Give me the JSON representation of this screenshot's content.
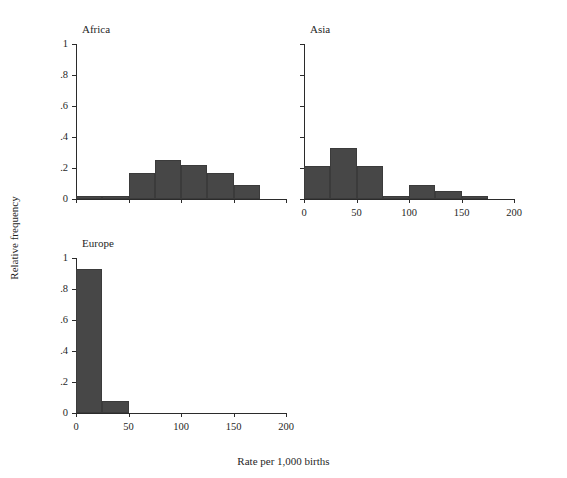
{
  "chart_data": {
    "type": "bar",
    "title": "",
    "subtitle": "",
    "xlabel": "Rate per 1,000 births",
    "ylabel": "Relative frequency",
    "xlim": [
      0,
      200
    ],
    "ylim": [
      0,
      1
    ],
    "grid": false,
    "legend": null,
    "bin_width": 25,
    "bar_color": "#474747",
    "axis_color": "#2b2b2b",
    "background": "#ffffff",
    "xticks": [
      0,
      50,
      100,
      150,
      200
    ],
    "xticklabels": [
      "0",
      "50",
      "100",
      "150",
      "200"
    ],
    "yticks": [
      0,
      0.2,
      0.4,
      0.6,
      0.8,
      1
    ],
    "yticklabels": [
      "0",
      ".2",
      ".4",
      ".6",
      ".8",
      "1"
    ],
    "panels": [
      {
        "name": "Africa",
        "row": 0,
        "col": 0,
        "show_ytick_labels": true,
        "show_xtick_labels": false,
        "bins": [
          {
            "x0": 0,
            "x1": 25,
            "value": 0.02
          },
          {
            "x0": 25,
            "x1": 50,
            "value": 0.02
          },
          {
            "x0": 50,
            "x1": 75,
            "value": 0.17
          },
          {
            "x0": 75,
            "x1": 100,
            "value": 0.25
          },
          {
            "x0": 100,
            "x1": 125,
            "value": 0.22
          },
          {
            "x0": 125,
            "x1": 150,
            "value": 0.17
          },
          {
            "x0": 150,
            "x1": 175,
            "value": 0.09
          }
        ]
      },
      {
        "name": "Asia",
        "row": 0,
        "col": 1,
        "show_ytick_labels": false,
        "show_xtick_labels": true,
        "bins": [
          {
            "x0": 0,
            "x1": 25,
            "value": 0.21
          },
          {
            "x0": 25,
            "x1": 50,
            "value": 0.33
          },
          {
            "x0": 50,
            "x1": 75,
            "value": 0.21
          },
          {
            "x0": 75,
            "x1": 100,
            "value": 0.02
          },
          {
            "x0": 100,
            "x1": 125,
            "value": 0.09
          },
          {
            "x0": 125,
            "x1": 150,
            "value": 0.05
          },
          {
            "x0": 150,
            "x1": 175,
            "value": 0.02
          }
        ]
      },
      {
        "name": "Europe",
        "row": 1,
        "col": 0,
        "show_ytick_labels": true,
        "show_xtick_labels": true,
        "bins": [
          {
            "x0": 0,
            "x1": 25,
            "value": 0.93
          },
          {
            "x0": 25,
            "x1": 50,
            "value": 0.08
          }
        ]
      }
    ]
  }
}
